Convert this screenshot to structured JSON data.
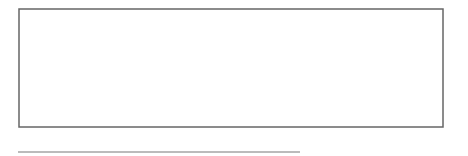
{
  "chart_data": {
    "type": "diagram",
    "title": "",
    "axis": {
      "min": 0,
      "max": 100,
      "major_step": 5,
      "minor_step": 1,
      "tick_labels": [
        "0",
        "5",
        "10",
        "15",
        "20",
        "25",
        "30",
        "35",
        "40",
        "45",
        "50",
        "55",
        "60",
        "65",
        "70",
        "75",
        "80",
        "85",
        "90",
        "95",
        "100"
      ]
    },
    "arcs": [
      {
        "from": 50,
        "to": 75,
        "peak_x": 63,
        "height": 0.95,
        "arrow_at": 75
      },
      {
        "from": 75,
        "to": 87,
        "peak_x": 81,
        "height": 0.78,
        "arrow_at": 87
      },
      {
        "from": 88,
        "to": 81,
        "peak_x": 83.5,
        "height": 0.42,
        "arrow_at": 81
      },
      {
        "from": 82,
        "to": 83,
        "peak_x": 82.3,
        "height": 0.16,
        "arrow_at": 83
      }
    ],
    "colors": {
      "line": "#222222",
      "frame": "#555555"
    }
  }
}
